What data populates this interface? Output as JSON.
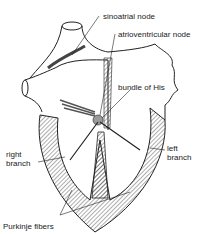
{
  "diagram": {
    "labels": {
      "sa_node": "sinoatrial node",
      "av_node": "atrioventricular node",
      "bundle_his": "bundle of His",
      "right_branch_l1": "right",
      "right_branch_l2": "branch",
      "left_branch_l1": "left",
      "left_branch_l2": "branch",
      "purkinje": "Purkinje fibers"
    },
    "colors": {
      "stroke": "#222222",
      "fill": "#ffffff",
      "node": "#9a9a9a"
    }
  }
}
